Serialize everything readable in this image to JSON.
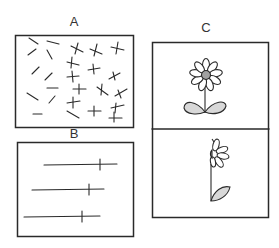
{
  "panels": {
    "a": {
      "label": "A",
      "description": "field of randomly oriented dashes on left, crosses on right"
    },
    "b": {
      "label": "B",
      "description": "three horizontal lines with vertical tick marks"
    },
    "c": {
      "label": "C",
      "description": "two stacked frames: full daisy with two leaves; side-view flower with one leaf"
    }
  },
  "colors": {
    "stroke": "#2a2a2a",
    "fill": "#d8d8d8",
    "center": "#a0a0a0"
  }
}
